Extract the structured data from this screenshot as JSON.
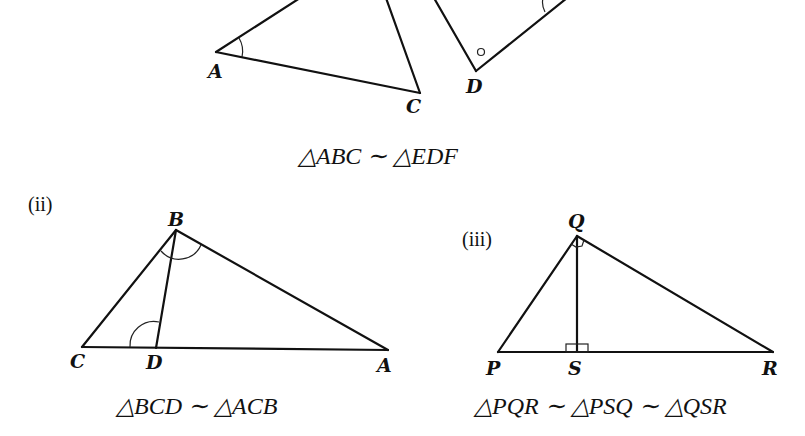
{
  "figure_i": {
    "vertex_labels": {
      "A": "A",
      "C": "C",
      "D": "D"
    },
    "caption": "△ABC ∼ △EDF"
  },
  "figure_ii": {
    "tag": "(ii)",
    "vertex_labels": {
      "B": "B",
      "C": "C",
      "D": "D",
      "A": "A"
    },
    "caption": "△BCD ∼ △ACB"
  },
  "figure_iii": {
    "tag": "(iii)",
    "vertex_labels": {
      "Q": "Q",
      "P": "P",
      "S": "S",
      "R": "R"
    },
    "caption": "△PQR ∼ △PSQ ∼ △QSR"
  }
}
